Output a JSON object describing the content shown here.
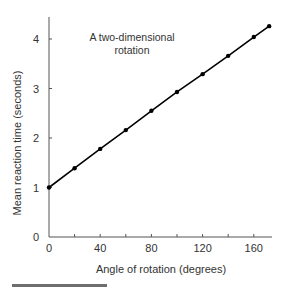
{
  "chart_data": {
    "type": "line",
    "title": "",
    "annotation": [
      "A two-dimensional",
      "rotation"
    ],
    "xlabel": "Angle of rotation (degrees)",
    "ylabel": "Mean reaction time (seconds)",
    "xlim": [
      0,
      175
    ],
    "ylim": [
      0,
      4.4
    ],
    "x_ticks": [
      0,
      40,
      80,
      120,
      160
    ],
    "x_minor_ticks": [
      20,
      60,
      100,
      140
    ],
    "y_ticks": [
      0,
      1,
      2,
      3,
      4
    ],
    "grid": false,
    "legend": null,
    "series": [
      {
        "name": "A two-dimensional rotation",
        "x": [
          0,
          20,
          40,
          60,
          80,
          100,
          120,
          140,
          160,
          172
        ],
        "y": [
          1.0,
          1.39,
          1.78,
          2.16,
          2.55,
          2.93,
          3.29,
          3.66,
          4.04,
          4.26
        ],
        "color": "#000000"
      }
    ]
  },
  "decor": {
    "bottom_bar_color": "#6e6e6e"
  }
}
